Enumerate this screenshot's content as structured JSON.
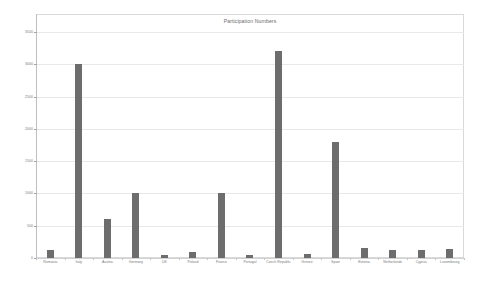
{
  "chart_data": {
    "type": "bar",
    "title": "Participation Numbers",
    "xlabel": "",
    "ylabel": "",
    "ylim": [
      0,
      3500
    ],
    "yticks": [
      0,
      500,
      1000,
      1500,
      2000,
      2500,
      3000,
      3500
    ],
    "ytick_labels": [
      "0",
      "500",
      "1000",
      "1500",
      "2000",
      "2500",
      "3000",
      "3500"
    ],
    "grid": true,
    "legend": false,
    "bar_color": "#6d6d6d",
    "categories": [
      "Romania",
      "Italy",
      "Austria",
      "Germany",
      "UK",
      "Poland",
      "France",
      "Portugal",
      "Czech Republic",
      "Greece",
      "Spain",
      "Estonia",
      "Netherlands",
      "Cyprus",
      "Luxembourg"
    ],
    "values": [
      130,
      3000,
      610,
      1010,
      40,
      95,
      1005,
      45,
      3200,
      55,
      1790,
      155,
      130,
      120,
      140
    ]
  }
}
